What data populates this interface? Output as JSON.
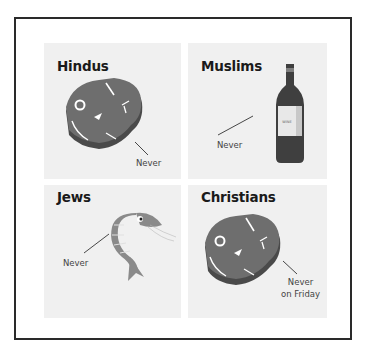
{
  "panels": [
    {
      "group": "Hindus",
      "item": "beef-steak",
      "rule": "Never"
    },
    {
      "group": "Muslims",
      "item": "wine-bottle",
      "rule": "Never",
      "bottle_label": "Wine"
    },
    {
      "group": "Jews",
      "item": "shrimp",
      "rule": "Never"
    },
    {
      "group": "Christians",
      "item": "beef-steak",
      "rule_line1": "Never",
      "rule_line2": "on Friday"
    }
  ],
  "colors": {
    "meat": "#6e6e6e",
    "meat_edge": "#4a4a4a",
    "bottle": "#3f3f3f",
    "shrimp": "#8a8a8a",
    "panel_bg": "#f0f0f0",
    "frame": "#2a2a2a"
  }
}
